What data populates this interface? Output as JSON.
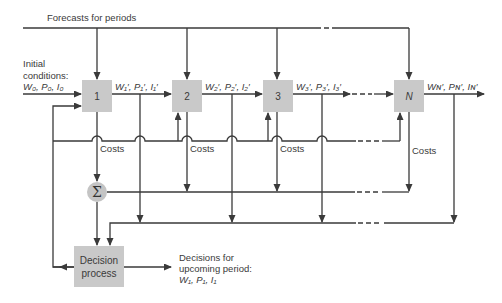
{
  "diagram": {
    "forecast_label": "Forecasts for periods",
    "initial_conditions": {
      "line1": "Initial",
      "line2": "conditions:",
      "line3": "W₀, P₀, I₀"
    },
    "periods": [
      {
        "id": "1",
        "label": "1",
        "output": "W₁′, P₁′, I₁′"
      },
      {
        "id": "2",
        "label": "2",
        "output": "W₂′, P₂′, I₂′"
      },
      {
        "id": "3",
        "label": "3",
        "output": "W₃′, P₃′, I₃′"
      },
      {
        "id": "N",
        "label": "N",
        "output": "Wɴ′, Pɴ′, Iɴ′"
      }
    ],
    "costs_label": "Costs",
    "sum_symbol": "Σ",
    "decision_box": {
      "line1": "Decision",
      "line2": "process"
    },
    "decisions_output": {
      "line1": "Decisions for",
      "line2": "upcoming period:",
      "line3": "W₁, P₁, I₁"
    },
    "colors": {
      "line": "#3a3a3a",
      "box_fill": "#c9c9c9",
      "sigma_fill": "#c4c4c4",
      "background": "#ffffff"
    }
  }
}
